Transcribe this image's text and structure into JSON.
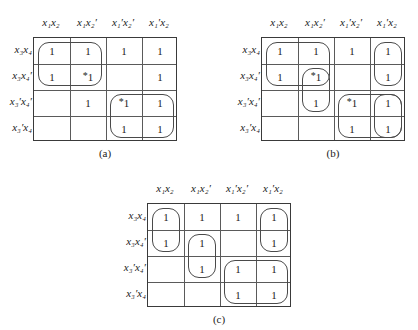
{
  "figure": {
    "kind": "karnaugh-map-set",
    "map_count": 3,
    "variables": [
      "x1",
      "x2",
      "x3",
      "x4"
    ],
    "cell_symbol": "1",
    "essential_marker": "*",
    "line_color": "#4a4a4a",
    "grid_border_color": "#3a3a3a",
    "text_color": "#222222"
  },
  "column_headers": [
    "x₁x₂",
    "x₁x₂′",
    "x₁′x₂′",
    "x₁′x₂"
  ],
  "row_headers": [
    "x₃x₄",
    "x₃x₄′",
    "x₃′x₄′",
    "x₃′x₄"
  ],
  "maps": [
    {
      "id": "a",
      "caption": "(a)",
      "cells": [
        [
          {
            "v": "1",
            "star": false
          },
          {
            "v": "1",
            "star": false
          },
          {
            "v": "1",
            "star": false
          },
          {
            "v": "1",
            "star": false
          }
        ],
        [
          {
            "v": "1",
            "star": false
          },
          {
            "v": "1",
            "star": true
          },
          {
            "v": "",
            "star": false
          },
          {
            "v": "1",
            "star": false
          }
        ],
        [
          {
            "v": "",
            "star": false
          },
          {
            "v": "1",
            "star": false
          },
          {
            "v": "1",
            "star": true
          },
          {
            "v": "1",
            "star": false
          }
        ],
        [
          {
            "v": "",
            "star": false
          },
          {
            "v": "",
            "star": false
          },
          {
            "v": "1",
            "star": false
          },
          {
            "v": "1",
            "star": false
          }
        ]
      ],
      "groups": [
        {
          "name": "group-r1r2-c1c2",
          "r0": 0,
          "c0": 0,
          "rows": 2,
          "cols": 2
        },
        {
          "name": "group-r3r4-c3c4",
          "r0": 2,
          "c0": 2,
          "rows": 2,
          "cols": 2
        }
      ]
    },
    {
      "id": "b",
      "caption": "(b)",
      "cells": [
        [
          {
            "v": "1",
            "star": false
          },
          {
            "v": "1",
            "star": false
          },
          {
            "v": "1",
            "star": false
          },
          {
            "v": "1",
            "star": false
          }
        ],
        [
          {
            "v": "1",
            "star": false
          },
          {
            "v": "1",
            "star": true
          },
          {
            "v": "",
            "star": false
          },
          {
            "v": "1",
            "star": false
          }
        ],
        [
          {
            "v": "",
            "star": false
          },
          {
            "v": "1",
            "star": false
          },
          {
            "v": "1",
            "star": true
          },
          {
            "v": "1",
            "star": false
          }
        ],
        [
          {
            "v": "",
            "star": false
          },
          {
            "v": "",
            "star": false
          },
          {
            "v": "1",
            "star": false
          },
          {
            "v": "1",
            "star": false
          }
        ]
      ],
      "groups": [
        {
          "name": "group-r1r2-c1c2",
          "r0": 0,
          "c0": 0,
          "rows": 2,
          "cols": 2
        },
        {
          "name": "group-r2r3-c2",
          "r0": 1,
          "c0": 1,
          "rows": 2,
          "cols": 1
        },
        {
          "name": "group-r1r2-c4",
          "r0": 0,
          "c0": 3,
          "rows": 2,
          "cols": 1
        },
        {
          "name": "group-r3r4-c3c4",
          "r0": 2,
          "c0": 2,
          "rows": 2,
          "cols": 2
        },
        {
          "name": "group-r3r4-c4",
          "r0": 2,
          "c0": 3,
          "rows": 2,
          "cols": 1
        }
      ]
    },
    {
      "id": "c",
      "caption": "(c)",
      "cells": [
        [
          {
            "v": "1",
            "star": false
          },
          {
            "v": "1",
            "star": false
          },
          {
            "v": "1",
            "star": false
          },
          {
            "v": "1",
            "star": false
          }
        ],
        [
          {
            "v": "1",
            "star": false
          },
          {
            "v": "1",
            "star": false
          },
          {
            "v": "",
            "star": false
          },
          {
            "v": "1",
            "star": false
          }
        ],
        [
          {
            "v": "",
            "star": false
          },
          {
            "v": "1",
            "star": false
          },
          {
            "v": "1",
            "star": false
          },
          {
            "v": "1",
            "star": false
          }
        ],
        [
          {
            "v": "",
            "star": false
          },
          {
            "v": "",
            "star": false
          },
          {
            "v": "1",
            "star": false
          },
          {
            "v": "1",
            "star": false
          }
        ]
      ],
      "groups": [
        {
          "name": "group-r1r2-c1",
          "r0": 0,
          "c0": 0,
          "rows": 2,
          "cols": 1
        },
        {
          "name": "group-r2r3-c2",
          "r0": 1,
          "c0": 1,
          "rows": 2,
          "cols": 1
        },
        {
          "name": "group-r1r2-c4",
          "r0": 0,
          "c0": 3,
          "rows": 2,
          "cols": 1
        },
        {
          "name": "group-r3r4-c3c4",
          "r0": 2,
          "c0": 2,
          "rows": 2,
          "cols": 2
        }
      ]
    }
  ],
  "layout": {
    "map_positions": [
      {
        "id": "a",
        "left": 0,
        "top": 16
      },
      {
        "id": "b",
        "left": 228,
        "top": 16
      },
      {
        "id": "c",
        "left": 114,
        "top": 182
      }
    ],
    "cell_width": 36,
    "cell_height": 26,
    "grid_left": 33,
    "grid_top": 21
  }
}
